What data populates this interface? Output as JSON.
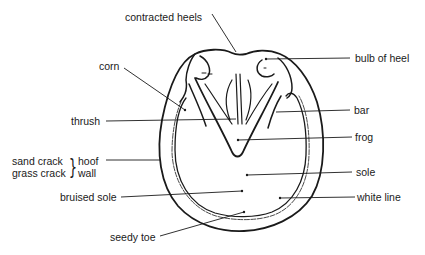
{
  "diagram": {
    "colors": {
      "line": "#1a1a1a",
      "background": "#ffffff"
    },
    "labels": {
      "contracted_heels": "contracted heels",
      "corn": "corn",
      "thrush": "thrush",
      "bulb_of_heel": "bulb of heel",
      "bar": "bar",
      "frog": "frog",
      "sand_crack": "sand crack",
      "grass_crack": "grass crack",
      "brace": "}",
      "hoof": "hoof",
      "wall": "wall",
      "sole": "sole",
      "bruised_sole": "bruised sole",
      "white_line": "white line",
      "seedy_toe": "seedy toe"
    }
  }
}
